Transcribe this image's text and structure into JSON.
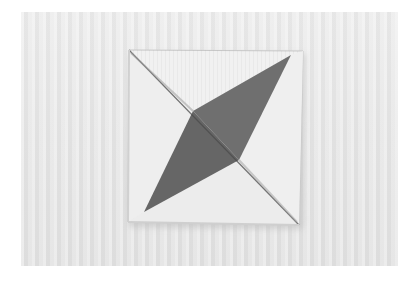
{
  "photo": {
    "subject": "folded fabric quilt square with two dark triangular patches",
    "palette": {
      "background_cloth": "#e8e8e8",
      "square_light": "#f2f2f2",
      "dark_patch": "#6e6e6e",
      "dark_patch_shade": "#5a5a5a",
      "shadow": "#bdbdbd"
    }
  },
  "caption": {
    "text": "",
    "note": "caption text cut off at bottom edge; only tops of characters visible"
  }
}
